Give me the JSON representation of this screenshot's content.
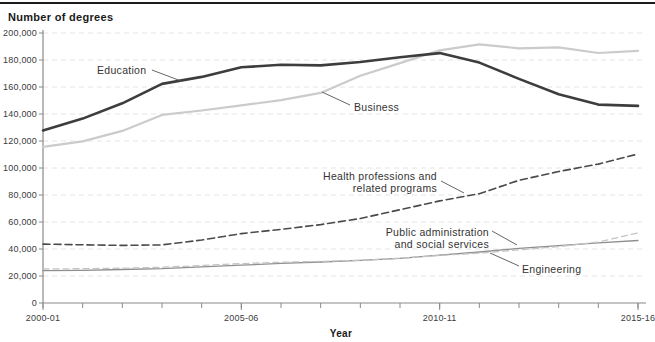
{
  "chart_data": {
    "type": "line",
    "title": "Number of degrees",
    "xlabel": "Year",
    "ylabel": "Number of degrees",
    "ylim": [
      0,
      200000
    ],
    "grid": "horizontal-dashed",
    "legend_position": "inline-annotations",
    "x_categories": [
      "2000-01",
      "2001-02",
      "2002-03",
      "2003-04",
      "2004-05",
      "2005-06",
      "2006-07",
      "2007-08",
      "2008-09",
      "2009-10",
      "2010-11",
      "2011-12",
      "2012-13",
      "2013-14",
      "2014-15",
      "2015-16"
    ],
    "y_ticks": [
      {
        "value": 200000,
        "label": "200,000"
      },
      {
        "value": 180000,
        "label": "180,000"
      },
      {
        "value": 160000,
        "label": "160,000"
      },
      {
        "value": 140000,
        "label": "140,000"
      },
      {
        "value": 120000,
        "label": "120,000"
      },
      {
        "value": 100000,
        "label": "100,000"
      },
      {
        "value": 80000,
        "label": "80,000"
      },
      {
        "value": 60000,
        "label": "60,000"
      },
      {
        "value": 40000,
        "label": "40,000"
      },
      {
        "value": 20000,
        "label": "20,000"
      },
      {
        "value": 0,
        "label": "0"
      }
    ],
    "x_major_ticks": [
      {
        "index": 0,
        "label": "2000-01"
      },
      {
        "index": 5,
        "label": "2005-06"
      },
      {
        "index": 10,
        "label": "2010-11"
      },
      {
        "index": 15,
        "label": "2015-16"
      }
    ],
    "series": [
      {
        "name": "Public administration and social services",
        "slug": "public-administration",
        "color": "#8f8f8f",
        "width": 1.3,
        "dash": null,
        "values": [
          24000,
          24200,
          24800,
          25500,
          26800,
          28000,
          29300,
          30400,
          31600,
          33000,
          35500,
          37800,
          40500,
          42500,
          44500,
          46300
        ]
      },
      {
        "name": "Engineering",
        "slug": "engineering",
        "color": "#c4c4c4",
        "width": 1.3,
        "dash": "6,4",
        "values": [
          25200,
          25400,
          25800,
          26500,
          27800,
          29200,
          30200,
          30800,
          31600,
          33200,
          35200,
          37000,
          39300,
          41800,
          45200,
          52000
        ]
      },
      {
        "name": "Health professions and related programs",
        "slug": "health-professions",
        "color": "#4a4a4a",
        "width": 1.6,
        "dash": "7,4",
        "values": [
          43600,
          43100,
          42700,
          43000,
          46700,
          51400,
          54500,
          58100,
          62600,
          69100,
          75600,
          81000,
          90900,
          97400,
          102900,
          110400
        ]
      },
      {
        "name": "Business",
        "slug": "business",
        "color": "#cbcbcb",
        "width": 2.2,
        "dash": null,
        "values": [
          115600,
          119700,
          127500,
          139300,
          142600,
          146400,
          150200,
          155600,
          168400,
          177700,
          187200,
          191600,
          188600,
          189300,
          185200,
          186800
        ]
      },
      {
        "name": "Education",
        "slug": "education",
        "color": "#3d3d3d",
        "width": 2.6,
        "dash": null,
        "values": [
          127800,
          136600,
          147900,
          162300,
          167500,
          174600,
          176500,
          176000,
          178500,
          182100,
          185100,
          178100,
          166000,
          154600,
          147000,
          146000
        ]
      }
    ],
    "annotations": [
      {
        "name": "education-label",
        "lines": [
          "Education"
        ],
        "x": 97,
        "y": 74,
        "anchor": "start",
        "pointer": [
          152,
          70,
          181,
          81
        ]
      },
      {
        "name": "business-label",
        "lines": [
          "Business"
        ],
        "x": 354,
        "y": 111,
        "anchor": "start",
        "pointer": [
          350,
          105,
          322,
          92
        ]
      },
      {
        "name": "health-professions-label",
        "lines": [
          "Health professions and",
          "related programs"
        ],
        "x": 437,
        "y": 180,
        "anchor": "end",
        "pointer": [
          441,
          181,
          464,
          193
        ]
      },
      {
        "name": "public-administration-label",
        "lines": [
          "Public administration",
          "and social services"
        ],
        "x": 489,
        "y": 236,
        "anchor": "end",
        "pointer": [
          492,
          231,
          517,
          245
        ]
      },
      {
        "name": "engineering-label",
        "lines": [
          "Engineering"
        ],
        "x": 522,
        "y": 273,
        "anchor": "start",
        "pointer": [
          519,
          266,
          490,
          253
        ]
      }
    ],
    "style": {
      "axis_color": "#8a8a8a",
      "grid_color": "#e4e4e4",
      "pointer_color": "#555555",
      "top_rule_color": "#1b1b1b"
    }
  }
}
